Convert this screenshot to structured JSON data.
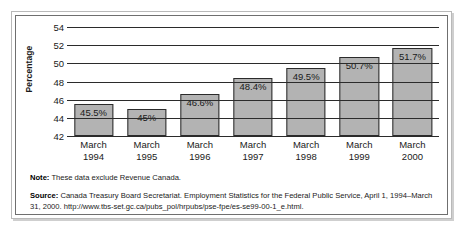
{
  "chart_data": {
    "type": "bar",
    "title": "",
    "xlabel": "",
    "ylabel": "Percentage",
    "ylim": [
      42,
      54
    ],
    "yticks": [
      54,
      52,
      50,
      48,
      46,
      44,
      42
    ],
    "grid": true,
    "legend": null,
    "categories": [
      "March\n1994",
      "March\n1995",
      "March\n1996",
      "March\n1997",
      "March\n1998",
      "March\n1999",
      "March\n2000"
    ],
    "values": [
      45.5,
      45.0,
      46.6,
      48.4,
      49.5,
      50.7,
      51.7
    ],
    "data_labels": [
      "45.5%",
      "45%",
      "46.6%",
      "48.4%",
      "49.5%",
      "50.7%",
      "51.7%"
    ],
    "bar_color": "#b3b3b3",
    "bar_border_color": "#2b2b2b",
    "gridline_color": "#2b2b2b"
  },
  "axis": {
    "y_title": "Percentage",
    "y_ticks": [
      "54",
      "52",
      "50",
      "48",
      "46",
      "44",
      "42"
    ],
    "x_categories": [
      {
        "line1": "March",
        "line2": "1994"
      },
      {
        "line1": "March",
        "line2": "1995"
      },
      {
        "line1": "March",
        "line2": "1996"
      },
      {
        "line1": "March",
        "line2": "1997"
      },
      {
        "line1": "March",
        "line2": "1998"
      },
      {
        "line1": "March",
        "line2": "1999"
      },
      {
        "line1": "March",
        "line2": "2000"
      }
    ]
  },
  "bars": [
    {
      "label": "45.5%",
      "value": 45.5
    },
    {
      "label": "45%",
      "value": 45.0
    },
    {
      "label": "46.6%",
      "value": 46.6
    },
    {
      "label": "48.4%",
      "value": 48.4
    },
    {
      "label": "49.5%",
      "value": 49.5
    },
    {
      "label": "50.7%",
      "value": 50.7
    },
    {
      "label": "51.7%",
      "value": 51.7
    }
  ],
  "footnotes": {
    "note_label": "Note:",
    "note_text": " These data exclude Revenue Canada.",
    "source_label": "Source:",
    "source_text": " Canada Treasury Board Secretariat. Employment Statistics for the Federal Public Service, April 1, 1994–March 31, 2000. http://www.tbs-set.gc.ca/pubs_pol/hrpubs/pse-fpe/es-se99-00-1_e.html."
  }
}
